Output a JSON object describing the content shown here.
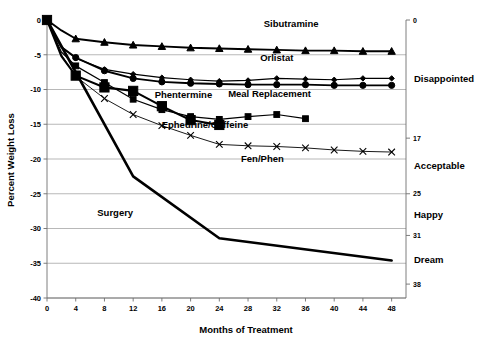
{
  "chart_data": {
    "type": "line",
    "title": "",
    "xlabel": "Months of Treatment",
    "ylabel": "Percent Weight Loss",
    "xlim": [
      0,
      50
    ],
    "ylim": [
      -40,
      0
    ],
    "grid": true,
    "legend": "inline-labels",
    "x_ticks": [
      0,
      4,
      8,
      12,
      16,
      20,
      24,
      28,
      32,
      36,
      40,
      44,
      48
    ],
    "y_ticks": [
      0,
      -5,
      -10,
      -15,
      -20,
      -25,
      -30,
      -35,
      -40
    ],
    "secondary_axis": {
      "position": "right",
      "ticks": [
        {
          "value": 0,
          "label": "0"
        },
        {
          "value": -17,
          "label": "17"
        },
        {
          "value": -25,
          "label": "25"
        },
        {
          "value": -31,
          "label": "31"
        },
        {
          "value": -38,
          "label": "38"
        }
      ],
      "categories": [
        {
          "label": "Disappointed",
          "value": -8.5
        },
        {
          "label": "Acceptable",
          "value": -21
        },
        {
          "label": "Happy",
          "value": -28
        },
        {
          "label": "Dream",
          "value": -34.5
        }
      ]
    },
    "series": [
      {
        "name": "Sibutramine",
        "marker": "triangle",
        "stroke_width": 1.9,
        "label_x": 34,
        "label_y": -1.0,
        "x": [
          0,
          2,
          4,
          8,
          12,
          16,
          20,
          24,
          28,
          32,
          36,
          40,
          44,
          48
        ],
        "y": [
          0,
          -1.5,
          -2.7,
          -3.2,
          -3.6,
          -3.8,
          -4.0,
          -4.1,
          -4.2,
          -4.3,
          -4.4,
          -4.4,
          -4.5,
          -4.5
        ]
      },
      {
        "name": "Orlistat",
        "marker": "diamond",
        "stroke_width": 1.2,
        "label_x": 32,
        "label_y": -5.9,
        "x": [
          0,
          2,
          4,
          8,
          12,
          16,
          20,
          24,
          28,
          32,
          36,
          40,
          44,
          48
        ],
        "y": [
          0,
          -3.9,
          -5.5,
          -7.1,
          -7.8,
          -8.3,
          -8.6,
          -8.8,
          -8.7,
          -8.4,
          -8.5,
          -8.6,
          -8.4,
          -8.4
        ]
      },
      {
        "name": "Meal Replacement",
        "marker": "circle",
        "stroke_width": 1.9,
        "label_x": 31,
        "label_y": -11.1,
        "x": [
          0,
          2,
          4,
          8,
          12,
          16,
          20,
          24,
          28,
          32,
          36,
          40,
          44,
          48
        ],
        "y": [
          0,
          -3.9,
          -5.4,
          -7.3,
          -8.4,
          -8.9,
          -9.1,
          -9.2,
          -9.3,
          -9.3,
          -9.3,
          -9.4,
          -9.4,
          -9.4
        ]
      },
      {
        "name": "Phentermine",
        "marker": "square-small",
        "stroke_width": 1.2,
        "label_x": 19,
        "label_y": -11.2,
        "x": [
          0,
          2,
          4,
          8,
          12,
          16,
          20,
          24,
          28,
          32,
          36
        ],
        "y": [
          0,
          -4.6,
          -6.6,
          -9.0,
          -11.4,
          -12.9,
          -13.9,
          -14.3,
          -13.9,
          -13.6,
          -14.2
        ]
      },
      {
        "name": "Ephedrine/Caffeine",
        "marker": "square-large",
        "stroke_width": 2.1,
        "label_x": 22,
        "label_y": -15.6,
        "x": [
          0,
          2,
          4,
          8,
          12,
          16,
          20,
          24
        ],
        "y": [
          0,
          -5.2,
          -8.0,
          -9.7,
          -10.2,
          -12.4,
          -14.4,
          -15.1
        ]
      },
      {
        "name": "Fen/Phen",
        "marker": "cross",
        "stroke_width": 0.9,
        "label_x": 30,
        "label_y": -20.5,
        "x": [
          0,
          2,
          4,
          8,
          12,
          16,
          20,
          24,
          28,
          32,
          36,
          40,
          44,
          48
        ],
        "y": [
          0,
          -5.0,
          -8.1,
          -11.3,
          -13.6,
          -15.2,
          -16.6,
          -17.9,
          -18.1,
          -18.2,
          -18.4,
          -18.7,
          -18.9,
          -19.0
        ]
      },
      {
        "name": "Surgery",
        "marker": "none",
        "stroke_width": 2.6,
        "label_x": 9.5,
        "label_y": -28.2,
        "x": [
          0,
          12,
          24,
          48
        ],
        "y": [
          0,
          -22.5,
          -31.4,
          -34.6
        ]
      }
    ]
  }
}
